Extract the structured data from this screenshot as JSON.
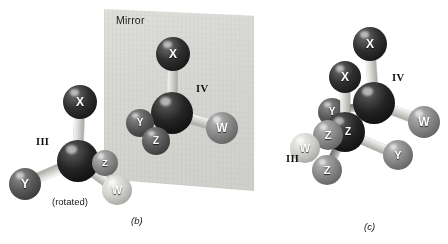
{
  "figure": {
    "mirror_label": "Mirror",
    "rotated_note": "(rotated)",
    "panel_b_caption": "(b)",
    "panel_c_caption": "(c)",
    "colors": {
      "background": "#ffffff",
      "mirror_plane": "#d7d8d4",
      "atom_center": "#141414",
      "atom_x": "#2a2a2a",
      "atom_y": "#585858",
      "atom_z": "#8a8a8a",
      "atom_w": "#d2d2ce"
    }
  },
  "chart_data": {
    "type": "diagram",
    "substituent_labels": [
      "X",
      "Y",
      "Z",
      "W"
    ],
    "structure_labels": [
      "III",
      "IV"
    ],
    "panels": [
      {
        "id": "b",
        "caption": "(b)",
        "notes": [
          "Mirror",
          "(rotated)"
        ],
        "structures": [
          {
            "label": "III",
            "label_pos": [
              36,
              136
            ],
            "center": {
              "x": 78,
              "y": 161,
              "r": 21,
              "shade": "center"
            },
            "atoms": [
              {
                "label": "X",
                "x": 80,
                "y": 102,
                "r": 17,
                "shade": "black",
                "bond": "light"
              },
              {
                "label": "Y",
                "x": 25,
                "y": 184,
                "r": 16,
                "shade": "dark",
                "bond": "light"
              },
              {
                "label": "Z",
                "x": 105,
                "y": 163,
                "r": 13,
                "shade": "mid",
                "bond": "dark"
              },
              {
                "label": "W",
                "x": 117,
                "y": 190,
                "r": 15,
                "shade": "light",
                "bond": "light"
              }
            ]
          },
          {
            "label": "IV",
            "label_pos": [
              196,
              83
            ],
            "center": {
              "x": 172,
              "y": 113,
              "r": 21,
              "shade": "center"
            },
            "atoms": [
              {
                "label": "X",
                "x": 173,
                "y": 54,
                "r": 17,
                "shade": "black",
                "bond": "light"
              },
              {
                "label": "Y",
                "x": 140,
                "y": 123,
                "r": 14,
                "shade": "dark",
                "bond": "dark"
              },
              {
                "label": "Z",
                "x": 156,
                "y": 141,
                "r": 14,
                "shade": "dark",
                "bond": "dark"
              },
              {
                "label": "W",
                "x": 222,
                "y": 128,
                "r": 16,
                "shade": "mid",
                "bond": "light"
              }
            ]
          }
        ]
      },
      {
        "id": "c",
        "caption": "(c)",
        "notes": [],
        "structures": [
          {
            "label": "IV",
            "label_pos": [
              392,
              72
            ],
            "center": {
              "x": 374,
              "y": 103,
              "r": 21,
              "shade": "center"
            },
            "atoms": [
              {
                "label": "X",
                "x": 370,
                "y": 44,
                "r": 17,
                "shade": "black",
                "bond": "light"
              },
              {
                "label": "Y",
                "x": 332,
                "y": 112,
                "r": 14,
                "shade": "dark",
                "bond": "dark"
              },
              {
                "label": "Z",
                "x": 348,
                "y": 132,
                "r": 14,
                "shade": "dark",
                "bond": "dark"
              },
              {
                "label": "W",
                "x": 424,
                "y": 122,
                "r": 16,
                "shade": "mid",
                "bond": "light"
              }
            ]
          },
          {
            "label": "III",
            "label_pos": [
              286,
              153
            ],
            "center": {
              "x": 345,
              "y": 132,
              "r": 20,
              "shade": "center"
            },
            "atoms": [
              {
                "label": "X",
                "x": 345,
                "y": 77,
                "r": 16,
                "shade": "black",
                "bond": "light"
              },
              {
                "label": "Y",
                "x": 398,
                "y": 155,
                "r": 15,
                "shade": "mid",
                "bond": "light"
              },
              {
                "label": "Z",
                "x": 328,
                "y": 135,
                "r": 15,
                "shade": "mid",
                "bond": "dark"
              },
              {
                "label": "W",
                "x": 305,
                "y": 148,
                "r": 15,
                "shade": "light",
                "bond": "light"
              },
              {
                "label": "Z",
                "x": 327,
                "y": 170,
                "r": 15,
                "shade": "mid",
                "bond": "dark"
              }
            ]
          }
        ]
      }
    ]
  }
}
